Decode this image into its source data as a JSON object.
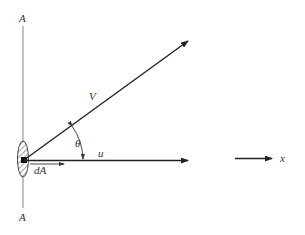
{
  "diagram": {
    "title": "",
    "labels": {
      "plane_top": "A",
      "plane_bottom": "A",
      "velocity": "V",
      "angle": "θ",
      "x_component": "u",
      "area_element": "dA",
      "axis": "x"
    },
    "elements": [
      {
        "id": "plane-line",
        "type": "line",
        "description": "vertical reference plane A-A"
      },
      {
        "id": "area-element",
        "type": "hatched-ellipse",
        "description": "differential area dA"
      },
      {
        "id": "velocity-vector",
        "type": "arrow",
        "label": "V"
      },
      {
        "id": "u-vector",
        "type": "arrow",
        "label": "u"
      },
      {
        "id": "dA-normal",
        "type": "arrow",
        "label": "dA"
      },
      {
        "id": "theta-arc",
        "type": "arc",
        "label": "θ"
      },
      {
        "id": "x-axis",
        "type": "arrow",
        "label": "x"
      }
    ],
    "colors": {
      "stroke": "#222222",
      "plane": "#888888",
      "text": "#333333"
    }
  }
}
